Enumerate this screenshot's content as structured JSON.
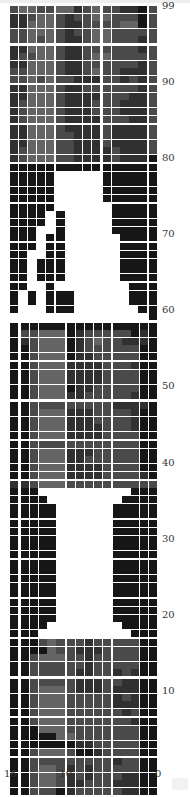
{
  "chart_data": {
    "type": "heatmap",
    "title": "",
    "xlabel": "",
    "ylabel": "",
    "columns": 16,
    "rows": 100,
    "x_ticks": [
      {
        "label": "16",
        "pos": 16
      },
      {
        "label": "10",
        "pos": 10
      },
      {
        "label": "0",
        "pos": 0
      }
    ],
    "y_ticks": [
      {
        "label": "99",
        "row": 99
      },
      {
        "label": "90",
        "row": 90
      },
      {
        "label": "80",
        "row": 80
      },
      {
        "label": "70",
        "row": 70
      },
      {
        "label": "60",
        "row": 60
      },
      {
        "label": "50",
        "row": 50
      },
      {
        "label": "40",
        "row": 40
      },
      {
        "label": "30",
        "row": 30
      },
      {
        "label": "20",
        "row": 20
      },
      {
        "label": "10",
        "row": 10
      }
    ],
    "shade_scale": "digit 0=white .. 9=black",
    "sections": [
      {
        "rows": "99-80",
        "group_split": "5,5,5,1",
        "data": [
          "7667766876778897",
          "8876678776677797",
          "8866678877776697",
          "7766678776677777",
          "7767678876677787",
          "8866678877777787",
          "8776678876677777",
          "8866678877777787",
          "7766678876778887",
          "7767677888778787",
          "8866678877777787",
          "8866678888777887",
          "8766678887778887",
          "8766678887778887",
          "8766678888777887",
          "8866678888788887",
          "8866677888788887",
          "8866677888788887",
          "8766677888878887",
          "8766677888878889"
        ]
      },
      {
        "rows": "79-60",
        "group_split": "5,5,5,1",
        "data": [
          "9999999999999999",
          "9999900000999999",
          "9999900000999999",
          "9999900000999999",
          "9999900000999999",
          "9999900000099999",
          "9999090000099999",
          "9999090000099999",
          "9990090000099999",
          "9990990000009999",
          "9990990000009999",
          "9900990000009999",
          "9909990000009999",
          "9909990000009999",
          "9909990000009999",
          "9900900000000999",
          "9090999000000999",
          "9090999000000999",
          "9000999000000099",
          "0000000000000009"
        ]
      },
      {
        "rows": "59-40",
        "group_split": "1,5,5,5",
        "data": [
          "9999999999999999",
          "9776669877777989",
          "9876669876778889",
          "9976669877777799",
          "9976669887777799",
          "9976668888777899",
          "9976668888777799",
          "9976668888777799",
          "9976669887777799",
          "9976668877777899",
          "9977777777788889",
          "9976668887777899",
          "9976668887777899",
          "9976668888777899",
          "9976668888777799",
          "9977777777777799",
          "9976668887777799",
          "9976668877777799",
          "9976668888777799",
          "9976668888777789"
        ]
      },
      {
        "rows": "39-20",
        "group_split": "1,5,5,5",
        "data": [
          "8876667777777777",
          "9990000000000999",
          "9999000000009999",
          "9999900000099999",
          "9999900000099999",
          "9999900000099999",
          "9999900000099999",
          "9999900000099999",
          "9999900000099999",
          "9999900000099999",
          "9999900000099999",
          "9999900000099999",
          "9999900000099999",
          "9999900000099999",
          "9999900000099999",
          "9999900000099999",
          "9999900000099999",
          "9999900000099999",
          "9999000000009999",
          "9990000000000999"
        ]
      },
      {
        "rows": "19-0",
        "group_split": "1,5,5,5",
        "data": [
          "9997677787777799",
          "9999677888777799",
          "9976667787777799",
          "9977777787777799",
          "9977777887787899",
          "9977777888778899",
          "9976667888788899",
          "9976667777787899",
          "9976667777788899",
          "9976667777778799",
          "9976667777777899",
          "9996667777777799",
          "9999966777777799",
          "9999999887777799",
          "9976667998777799",
          "9977777777787799",
          "9976678787777799",
          "9976678787778899",
          "9976678877788899",
          "9977798777778899"
        ]
      }
    ]
  }
}
